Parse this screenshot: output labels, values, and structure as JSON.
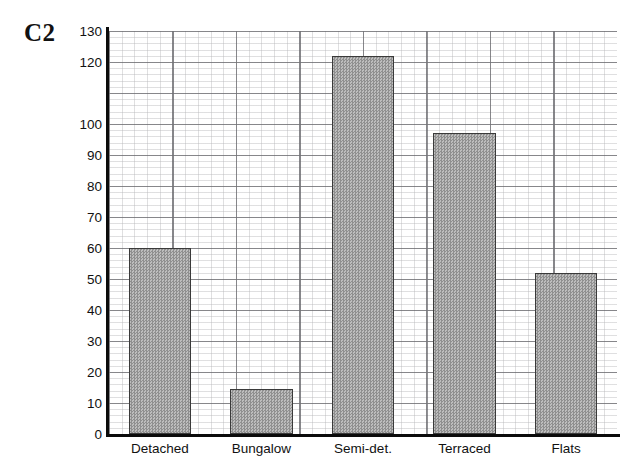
{
  "chart_data": {
    "type": "bar",
    "title": "C2",
    "xlabel": "",
    "ylabel": "",
    "categories": [
      "Detached",
      "Bungalow",
      "Semi-det.",
      "Terraced",
      "Flats"
    ],
    "values": [
      60,
      14.5,
      122,
      97,
      52
    ],
    "ylim": [
      0,
      130
    ],
    "ytick_labels": [
      "130",
      "120",
      "100",
      "90",
      "80",
      "70",
      "60",
      "50",
      "40",
      "30",
      "20",
      "10",
      "0"
    ],
    "ytick_values": [
      130,
      120,
      100,
      90,
      80,
      70,
      60,
      50,
      40,
      30,
      20,
      10,
      0
    ],
    "gridlines": true,
    "grid_style": "graph-paper dotted minor with major lines every 10 units",
    "legend": null,
    "bar_fill_color": "#a6a6a6",
    "bar_edge_color": "#3a3a3a",
    "axis_color": "#0b0b0b",
    "grid_color": "#55555a",
    "background_color": "#ffffff"
  }
}
